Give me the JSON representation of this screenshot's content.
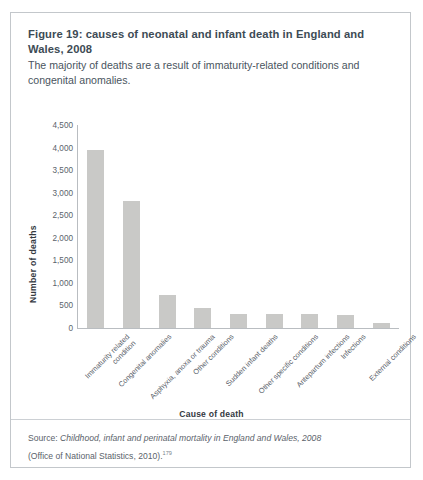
{
  "figure": {
    "title": "Figure 19: causes of neonatal and infant death in England and Wales, 2008",
    "subtitle": "The majority of deaths are a result of immaturity-related conditions and congenital anomalies.",
    "source_prefix": "Source: ",
    "source_italic": "Childhood, infant and perinatal mortality in England and Wales, 2008",
    "source_line2": "(Office of National Statistics, 2010).",
    "source_superscript": "179"
  },
  "chart_data": {
    "type": "bar",
    "title": "Figure 19: causes of neonatal and infant death in England and Wales, 2008",
    "xlabel": "Cause of death",
    "ylabel": "Number of  deaths",
    "ylim": [
      0,
      4500
    ],
    "ytick_labels": [
      "4,500",
      "4,000",
      "3,500",
      "3,000",
      "2,500",
      "2,000",
      "1,500",
      "1,000",
      "500",
      "0"
    ],
    "ytick_values": [
      4500,
      4000,
      3500,
      3000,
      2500,
      2000,
      1500,
      1000,
      500,
      0
    ],
    "grid": false,
    "legend": false,
    "bar_color": "#c9c9c7",
    "categories": [
      "Immaturity related condition",
      "Congenital anomalies",
      "Asphyxia, anoxa or trauma",
      "Other conditions",
      "Sudden infant deaths",
      "Other specific conditions",
      "Antepartum infections",
      "Infections",
      "External conditions"
    ],
    "category_lines": [
      [
        "Immaturity related",
        "condition"
      ],
      [
        "Congenital anomalies"
      ],
      [
        "Asphyxia, anoxa or trauma"
      ],
      [
        "Other conditions"
      ],
      [
        "Sudden infant deaths"
      ],
      [
        "Other specific conditions"
      ],
      [
        "Antepartum infections"
      ],
      [
        "Infections"
      ],
      [
        "External conditions"
      ]
    ],
    "values": [
      3950,
      2810,
      730,
      440,
      310,
      310,
      300,
      290,
      120
    ]
  }
}
